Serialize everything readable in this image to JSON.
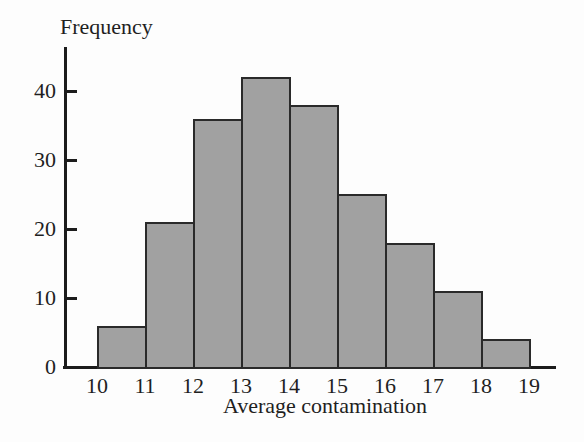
{
  "chart_data": {
    "type": "bar",
    "subtype": "histogram",
    "title": "",
    "ylabel": "Frequency",
    "xlabel": "Average contamination",
    "bin_edges": [
      10,
      11,
      12,
      13,
      14,
      15,
      16,
      17,
      18,
      19
    ],
    "categories": [
      "10-11",
      "11-12",
      "12-13",
      "13-14",
      "14-15",
      "15-16",
      "16-17",
      "17-18",
      "18-19"
    ],
    "values": [
      6,
      21,
      36,
      42,
      38,
      25,
      18,
      11,
      4
    ],
    "x_tick_labels": [
      "10",
      "11",
      "12",
      "13",
      "14",
      "15",
      "16",
      "17",
      "18",
      "19"
    ],
    "y_ticks": [
      0,
      10,
      20,
      30,
      40
    ],
    "ylim": [
      0,
      46
    ],
    "xlim": [
      10,
      19
    ],
    "grid": false,
    "legend_position": "none",
    "colors": {
      "bar_fill": "#a1a1a1",
      "bar_border": "#2a2a2a",
      "axis": "#1c1c1c",
      "text": "#1f1f1f",
      "background": "#fdfdfd"
    }
  }
}
